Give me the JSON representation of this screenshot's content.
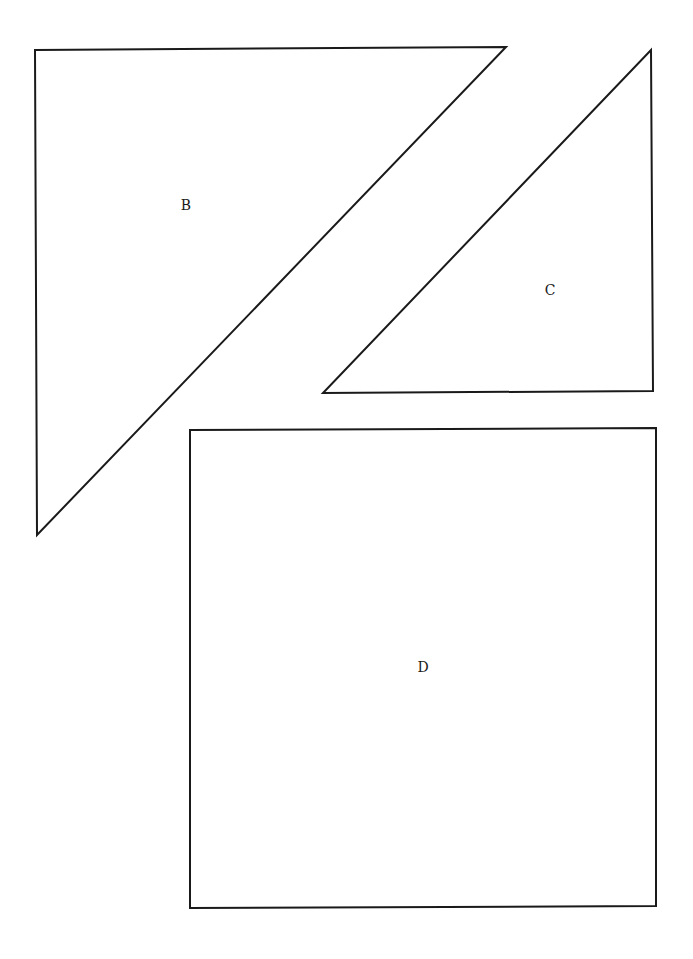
{
  "diagram": {
    "background": "#ffffff",
    "stroke_color": "#1a1a1a",
    "shapes": [
      {
        "id": "B",
        "type": "right-triangle",
        "label": "B",
        "points": [
          [
            35,
            50
          ],
          [
            506,
            47
          ],
          [
            37,
            535
          ]
        ],
        "label_position": [
          186,
          205
        ]
      },
      {
        "id": "C",
        "type": "right-triangle",
        "label": "C",
        "points": [
          [
            651,
            50
          ],
          [
            653,
            391
          ],
          [
            323,
            393
          ]
        ],
        "label_position": [
          550,
          290
        ]
      },
      {
        "id": "D",
        "type": "square",
        "label": "D",
        "points": [
          [
            190,
            430
          ],
          [
            656,
            428
          ],
          [
            656,
            906
          ],
          [
            190,
            908
          ]
        ],
        "label_position": [
          423,
          667
        ]
      }
    ]
  }
}
